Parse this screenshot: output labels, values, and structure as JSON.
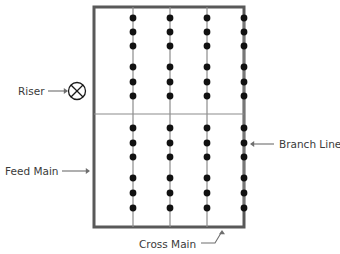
{
  "diagram": {
    "canvas": {
      "width": 340,
      "height": 254
    },
    "colors": {
      "outline": "#595959",
      "branch_line": "#8c8c8c",
      "cross_main_line": "#8c8c8c",
      "dot": "#111111",
      "text": "#3a3a3a",
      "leader": "#6e6e6e",
      "background": "#ffffff"
    },
    "rectangle": {
      "name": "feed-main-loop",
      "left": 94,
      "top": 7,
      "right": 244,
      "bottom": 227,
      "stroke_width": 3
    },
    "cross_main": {
      "name": "cross-main-line",
      "x1": 94,
      "y1": 114,
      "x2": 244,
      "y2": 114,
      "stroke_width": 1.2
    },
    "branch_columns": [
      133,
      170,
      207,
      244
    ],
    "sprinkler_rows": [
      18,
      32,
      46,
      67,
      82,
      96,
      128,
      143,
      157,
      178,
      193,
      208
    ],
    "sprinkler_radius": 3.4,
    "sprinkler_count": 48,
    "riser": {
      "name": "riser-symbol",
      "cx": 77,
      "cy": 91,
      "r": 8.5,
      "symbol": "circle-with-x"
    },
    "labels": [
      {
        "id": "riser",
        "text": "Riser",
        "text_x": 18,
        "text_y": 95,
        "anchor": "start",
        "leader": {
          "x1": 48,
          "y1": 91,
          "x2": 66,
          "y2": 91
        },
        "arrow": {
          "x": 68,
          "y": 91,
          "direction": "right"
        }
      },
      {
        "id": "feed-main",
        "text": "Feed Main",
        "text_x": 5,
        "text_y": 175,
        "anchor": "start",
        "leader": {
          "x1": 62,
          "y1": 171,
          "x2": 88,
          "y2": 171
        },
        "arrow": {
          "x": 90,
          "y": 171,
          "direction": "right"
        }
      },
      {
        "id": "branch-line",
        "text": "Branch Line",
        "text_x": 279,
        "text_y": 148,
        "anchor": "start",
        "leader": {
          "x1": 274,
          "y1": 144,
          "x2": 252,
          "y2": 144
        },
        "arrow": {
          "x": 250,
          "y": 144,
          "direction": "left"
        }
      },
      {
        "id": "cross-main",
        "text": "Cross Main",
        "text_x": 139,
        "text_y": 248,
        "anchor": "start",
        "leader_path": "M 201 243 L 215 243 L 221 233",
        "arrow": {
          "x": 222,
          "y": 230,
          "direction": "up"
        }
      }
    ]
  }
}
